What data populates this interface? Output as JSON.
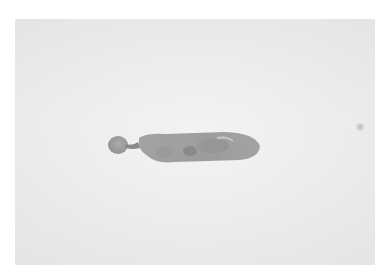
{
  "image": {
    "description": "Grayscale photograph of an elongated specimen on a light background",
    "colors": {
      "background": "#eeeeee",
      "specimen_body": "#8a8a8a",
      "specimen_dark": "#5a5a5a",
      "specimen_highlight": "#b5b5b5"
    }
  }
}
